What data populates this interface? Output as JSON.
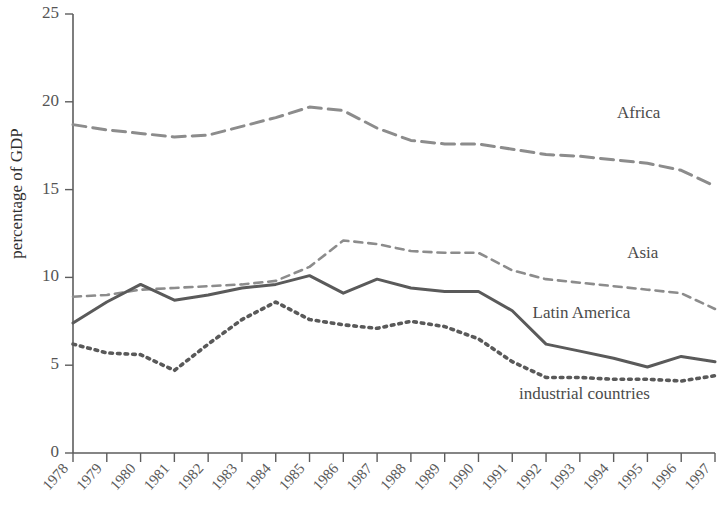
{
  "chart_data": {
    "type": "line",
    "title": "",
    "xlabel": "",
    "ylabel": "percentage of GDP",
    "ylim": [
      0,
      25
    ],
    "yticks": [
      0,
      5,
      10,
      15,
      20,
      25
    ],
    "grid": false,
    "legend_position": "inline-right",
    "categories": [
      "1978",
      "1979",
      "1980",
      "1981",
      "1982",
      "1983",
      "1984",
      "1985",
      "1986",
      "1987",
      "1988",
      "1989",
      "1990",
      "1991",
      "1992",
      "1993",
      "1994",
      "1995",
      "1996",
      "1997"
    ],
    "series": [
      {
        "name": "Africa",
        "style": "long-dash",
        "color": "#8c8c8c",
        "values": [
          18.7,
          18.4,
          18.2,
          18.0,
          18.1,
          18.6,
          19.1,
          19.7,
          19.5,
          18.5,
          17.8,
          17.6,
          17.6,
          17.3,
          17.0,
          16.9,
          16.7,
          16.5,
          16.1,
          15.2
        ]
      },
      {
        "name": "Asia",
        "style": "short-dash",
        "color": "#8c8c8c",
        "values": [
          8.9,
          9.0,
          9.3,
          9.4,
          9.5,
          9.6,
          9.8,
          10.6,
          12.1,
          11.9,
          11.5,
          11.4,
          11.4,
          10.4,
          9.9,
          9.7,
          9.5,
          9.3,
          9.1,
          8.2
        ]
      },
      {
        "name": "Latin America",
        "style": "solid",
        "color": "#5a5a5a",
        "values": [
          7.4,
          8.6,
          9.6,
          8.7,
          9.0,
          9.4,
          9.6,
          10.1,
          9.1,
          9.9,
          9.4,
          9.2,
          9.2,
          8.1,
          6.2,
          5.8,
          5.4,
          4.9,
          5.5,
          5.2
        ]
      },
      {
        "name": "industrial countries",
        "style": "dotted",
        "color": "#595959",
        "values": [
          6.2,
          5.7,
          5.6,
          4.7,
          6.2,
          7.6,
          8.6,
          7.6,
          7.3,
          7.1,
          7.5,
          7.2,
          6.5,
          5.2,
          4.3,
          4.3,
          4.2,
          4.2,
          4.1,
          4.4
        ]
      }
    ],
    "series_label_positions": [
      {
        "name": "Africa",
        "x": 1994.1,
        "y": 19.1
      },
      {
        "name": "Asia",
        "x": 1994.4,
        "y": 11.1
      },
      {
        "name": "Latin America",
        "x": 1991.6,
        "y": 7.7
      },
      {
        "name": "industrial countries",
        "x": 1991.2,
        "y": 3.1
      }
    ]
  }
}
